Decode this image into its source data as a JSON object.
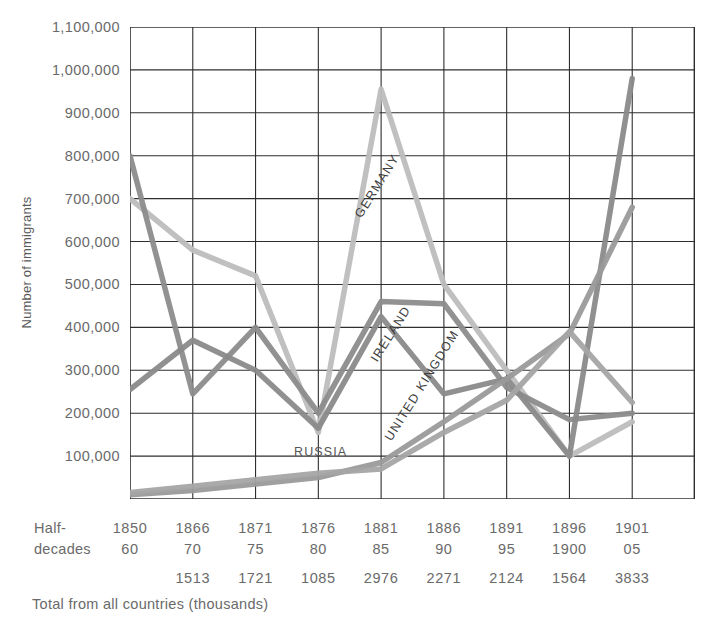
{
  "axes": {
    "y_title": "Number of immigrants",
    "y_ticks": [
      "1,100,000",
      "1,000,000",
      "900,000",
      "800,000",
      "700,000",
      "600,000",
      "500,000",
      "400,000",
      "300,000",
      "200,000",
      "100,000"
    ],
    "row_label_line1": "Half-",
    "row_label_line2": "decades",
    "footnote": "Total from all countries (thousands)"
  },
  "series_labels": {
    "germany": "GERMANY",
    "ireland": "IRELAND",
    "united_kingdom": "UNITED KINGDOM",
    "russia": "RUSSIA"
  },
  "chart_data": {
    "type": "line",
    "title": "",
    "xlabel": "Half-decades",
    "ylabel": "Number of immigrants",
    "ylim": [
      0,
      1100000
    ],
    "grid": true,
    "legend": "inline-labels",
    "categories": [
      "1850-60",
      "1866-70",
      "1871-75",
      "1876-80",
      "1881-85",
      "1886-90",
      "1891-95",
      "1896-1900",
      "1901-05"
    ],
    "category_top": [
      "1850",
      "1866",
      "1871",
      "1876",
      "1881",
      "1886",
      "1891",
      "1896",
      "1901"
    ],
    "category_bottom": [
      "60",
      "70",
      "75",
      "80",
      "85",
      "90",
      "95",
      "1900",
      "05"
    ],
    "totals_thousands": [
      "",
      "1513",
      "1721",
      "1085",
      "2976",
      "2271",
      "2124",
      "1564",
      "3833"
    ],
    "totals_label": "Total from all countries (thousands)",
    "series": [
      {
        "name": "GERMANY",
        "color": "#bdbdbd",
        "values": [
          700000,
          580000,
          520000,
          155000,
          955000,
          500000,
          300000,
          100000,
          180000
        ]
      },
      {
        "name": "IRELAND",
        "color": "#8c8c8c",
        "values": [
          800000,
          245000,
          400000,
          200000,
          460000,
          455000,
          260000,
          185000,
          200000
        ]
      },
      {
        "name": "UNITED KINGDOM",
        "color": "#8a8a8a",
        "values": [
          255000,
          370000,
          300000,
          165000,
          425000,
          245000,
          280000,
          100000,
          980000
        ]
      },
      {
        "name": "RUSSIA",
        "color": "#9a9a9a",
        "values": [
          10000,
          20000,
          35000,
          50000,
          85000,
          180000,
          280000,
          385000,
          680000
        ]
      },
      {
        "name": "RUSSIA-SECOND",
        "color": "#a5a5a5",
        "values": [
          15000,
          30000,
          45000,
          60000,
          70000,
          155000,
          230000,
          390000,
          225000
        ]
      }
    ]
  }
}
